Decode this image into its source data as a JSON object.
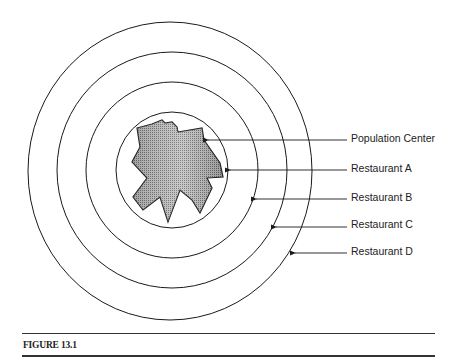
{
  "figure": {
    "caption": "FIGURE 13.1",
    "labels": [
      {
        "id": "population-center",
        "text": "Population Center",
        "y": 140,
        "arrow_tip_x": 207
      },
      {
        "id": "restaurant-a",
        "text": "Restaurant A",
        "y": 170,
        "arrow_tip_x": 229
      },
      {
        "id": "restaurant-b",
        "text": "Restaurant B",
        "y": 199,
        "arrow_tip_x": 255
      },
      {
        "id": "restaurant-c",
        "text": "Restaurant C",
        "y": 227,
        "arrow_tip_x": 275
      },
      {
        "id": "restaurant-d",
        "text": "Restaurant D",
        "y": 253,
        "arrow_tip_x": 294
      }
    ],
    "rings": [
      {
        "name": "Restaurant A",
        "rx": 56,
        "ry": 58
      },
      {
        "name": "Restaurant B",
        "rx": 86,
        "ry": 88
      },
      {
        "name": "Restaurant C",
        "rx": 115,
        "ry": 118
      },
      {
        "name": "Restaurant D",
        "rx": 142,
        "ry": 149
      }
    ],
    "colors": {
      "line": "#1a1a1a",
      "fill": "#9a9a9a",
      "background": "#ffffff"
    }
  }
}
